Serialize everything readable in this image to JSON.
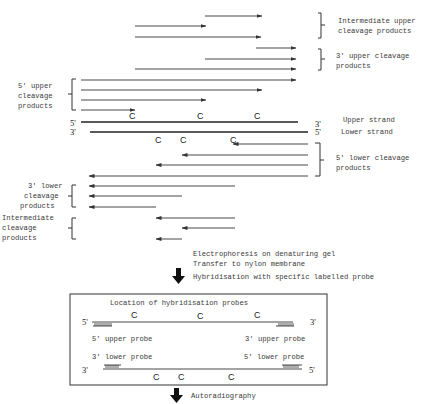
{
  "top_panel": {
    "groups": {
      "intermediate_upper": {
        "label_line1": "Intermediate upper",
        "label_line2": "cleavage products"
      },
      "three_upper": {
        "label_line1": "3' upper cleavage",
        "label_line2": "products"
      },
      "five_upper": {
        "label_line1": "5' upper",
        "label_line2": "cleavage",
        "label_line3": "products"
      },
      "five_lower": {
        "label_line1": "5' lower cleavage",
        "label_line2": "products"
      },
      "three_lower": {
        "label_line1": "3' lower",
        "label_line2": "cleavage",
        "label_line3": "products"
      },
      "intermediate_lower": {
        "label_line1": "Intermediate",
        "label_line2": "cleavage",
        "label_line3": "products"
      }
    },
    "upper_strand": {
      "left_end": "5'",
      "right_end": "3'",
      "label": "Upper strand",
      "site_label": "C"
    },
    "lower_strand": {
      "left_end": "3'",
      "right_end": "5'",
      "label": "Lower strand",
      "site_label": "C"
    }
  },
  "steps": {
    "step1_line1": "Electrophoresis on denaturing gel",
    "step1_line2": "Transfer to nylon membrane",
    "step1_line3": "Hybridisation with specific labelled probe",
    "step2": "Autoradiography"
  },
  "probe_box": {
    "title": "Location of hybridisation probes",
    "upper_left_end": "5'",
    "upper_right_end": "3'",
    "lower_left_end": "3'",
    "lower_right_end": "5'",
    "five_upper_probe": "5' upper probe",
    "three_upper_probe": "3' upper probe",
    "three_lower_probe": "3' lower probe",
    "five_lower_probe": "5' lower probe",
    "site_label": "C"
  }
}
